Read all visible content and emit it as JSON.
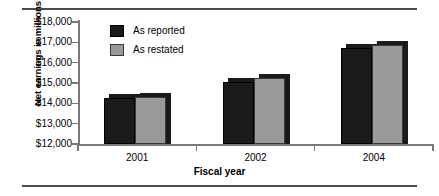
{
  "chart_data": {
    "type": "bar",
    "title": "",
    "xlabel": "Fiscal year",
    "ylabel": "Net earnings in millions",
    "categories": [
      "2001",
      "2002",
      "2004"
    ],
    "series": [
      {
        "name": "As reported",
        "color": "#1a1a1a",
        "values": [
          14250,
          15050,
          16700
        ]
      },
      {
        "name": "As restated",
        "color": "#9a9a9a",
        "values": [
          14300,
          15250,
          16850
        ]
      }
    ],
    "ylim": [
      12000,
      18000
    ],
    "yticks": [
      18000,
      17000,
      16000,
      15000,
      14000,
      13000,
      12000
    ],
    "ytick_labels": [
      "$18,000",
      "$17,000",
      "$16,000",
      "$15,000",
      "$14,000",
      "$13,000",
      "$12,000"
    ],
    "grid": false,
    "legend_position": "upper-left-inside"
  },
  "axes": {
    "y_title": "Net earnings in millions",
    "x_title": "Fiscal year"
  },
  "legend": {
    "items": [
      {
        "label": "As reported"
      },
      {
        "label": "As restated"
      }
    ]
  }
}
